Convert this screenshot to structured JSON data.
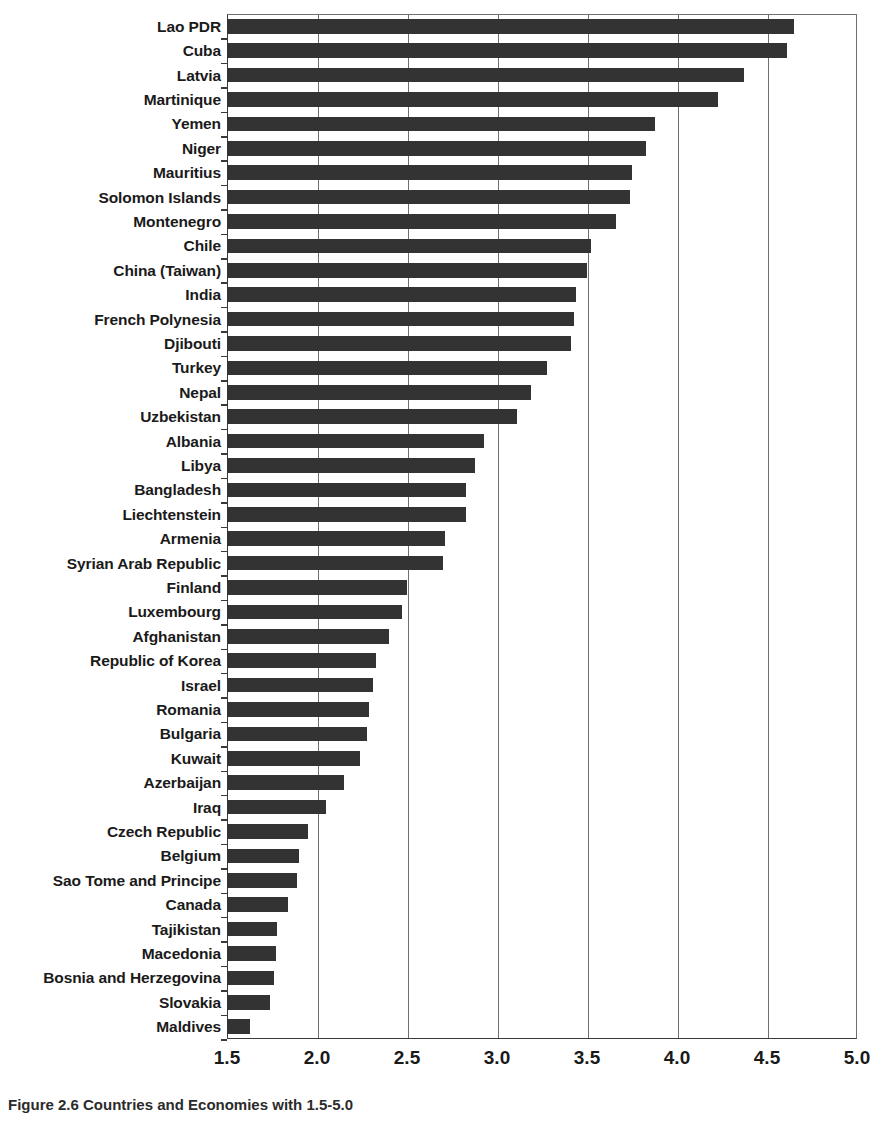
{
  "caption": "Figure 2.6  Countries and Economies with 1.5-5.0",
  "axis": {
    "x_ticks": [
      "1.5",
      "2.0",
      "2.5",
      "3.0",
      "3.5",
      "4.0",
      "4.5",
      "5.0"
    ],
    "x_min": 1.5,
    "x_max": 5.0,
    "x_step": 0.5
  },
  "colors": {
    "bar": "#333333",
    "axis": "#3a3a3a",
    "grid": "#6f6f6f",
    "background": "#ffffff",
    "text": "#1a1a1a"
  },
  "chart_data": {
    "type": "bar",
    "orientation": "horizontal",
    "title": "",
    "xlabel": "",
    "ylabel": "",
    "xlim": [
      1.5,
      5.0
    ],
    "grid": true,
    "legend": "none",
    "categories": [
      "Lao PDR",
      "Cuba",
      "Latvia",
      "Martinique",
      "Yemen",
      "Niger",
      "Mauritius",
      "Solomon Islands",
      "Montenegro",
      "Chile",
      "China (Taiwan)",
      "India",
      "French Polynesia",
      "Djibouti",
      "Turkey",
      "Nepal",
      "Uzbekistan",
      "Albania",
      "Libya",
      "Bangladesh",
      "Liechtenstein",
      "Armenia",
      "Syrian Arab Republic",
      "Finland",
      "Luxembourg",
      "Afghanistan",
      "Republic of Korea",
      "Israel",
      "Romania",
      "Bulgaria",
      "Kuwait",
      "Azerbaijan",
      "Iraq",
      "Czech Republic",
      "Belgium",
      "Sao Tome and Principe",
      "Canada",
      "Tajikistan",
      "Macedonia",
      "Bosnia and Herzegovina",
      "Slovakia",
      "Maldives"
    ],
    "values": [
      4.65,
      4.61,
      4.37,
      4.23,
      3.88,
      3.83,
      3.75,
      3.74,
      3.66,
      3.52,
      3.5,
      3.44,
      3.43,
      3.41,
      3.28,
      3.19,
      3.11,
      2.93,
      2.88,
      2.83,
      2.83,
      2.71,
      2.7,
      2.5,
      2.47,
      2.4,
      2.33,
      2.31,
      2.29,
      2.28,
      2.24,
      2.15,
      2.05,
      1.95,
      1.9,
      1.89,
      1.84,
      1.78,
      1.77,
      1.76,
      1.74,
      1.63
    ]
  }
}
